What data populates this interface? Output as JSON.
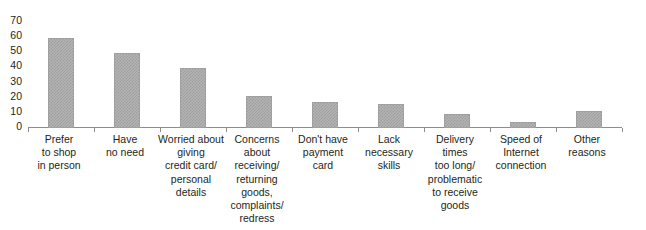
{
  "chart_data": {
    "type": "bar",
    "title": "",
    "xlabel": "",
    "ylabel": "",
    "ylim": [
      0,
      70
    ],
    "yticks": [
      0,
      10,
      20,
      30,
      40,
      50,
      60,
      70
    ],
    "grid": false,
    "legend": null,
    "bar_color": "#b3b3b3",
    "bar_pattern": "fine-checkerboard-dither",
    "categories": [
      "Prefer\nto shop\nin person",
      "Have\nno need",
      "Worried about\ngiving\ncredit card/\npersonal\ndetails",
      "Concerns\nabout\nreceiving/\nreturning\ngoods,\ncomplaints/\nredress",
      "Don't have\npayment\ncard",
      "Lack\nnecessary\nskills",
      "Delivery\ntimes\ntoo long/\nproblematic\nto receive\ngoods",
      "Speed of\nInternet\nconnection",
      "Other\nreasons"
    ],
    "values": [
      59,
      49,
      39,
      21,
      17,
      16,
      9,
      4,
      11
    ]
  },
  "axis": {
    "y_tick_labels": [
      "70",
      "60",
      "50",
      "40",
      "30",
      "20",
      "10",
      "0"
    ]
  },
  "cropped_title": " "
}
